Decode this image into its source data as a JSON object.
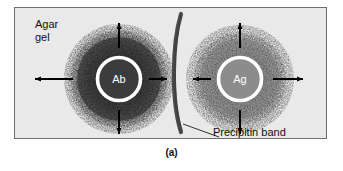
{
  "figure": {
    "caption": "(a)",
    "panel_background": "#e9e9e9",
    "border_color": "#6e6e6e",
    "page_background": "#ffffff"
  },
  "labels": {
    "agar_gel": "Agar\ngel",
    "precipitin_band": "Precipitin band"
  },
  "wells": [
    {
      "id": "antibody-well",
      "text": "Ab",
      "name": "antibody",
      "cx": 118,
      "cy": 78,
      "radius": 23,
      "fill": "#3c3c3c",
      "ring_color": "#ffffff",
      "ring_width": 4,
      "cloud_color": "#4a4a4a",
      "cloud_radius": 56,
      "label_color": "#ffffff"
    },
    {
      "id": "antigen-well",
      "text": "Ag",
      "name": "antigen",
      "cx": 239,
      "cy": 78,
      "radius": 23,
      "fill": "#8c8c8c",
      "ring_color": "#ffffff",
      "ring_width": 4,
      "cloud_color": "#949494",
      "cloud_radius": 54,
      "label_color": "#ffffff"
    }
  ],
  "precipitin_band": {
    "color": "#4c4c4c",
    "description": "vertical curved crescent arc between the two wells"
  },
  "diffusion_arrows": {
    "color": "#000000",
    "description": "arrows radiating outward from each well showing diffusion direction",
    "directions": [
      "up",
      "down",
      "left",
      "right"
    ]
  },
  "leader_line": {
    "color": "#333333",
    "description": "line from Precipitin band text to the band"
  }
}
